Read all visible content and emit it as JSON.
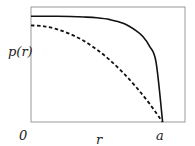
{
  "chart_data": {
    "type": "line",
    "title": "",
    "xlabel": "r",
    "ylabel": "p(r)",
    "x_ticks": [
      "0",
      "a"
    ],
    "xlim": [
      0,
      1.17
    ],
    "ylim": [
      0,
      1.0
    ],
    "grid": false,
    "legend": "none",
    "series": [
      {
        "name": "solid",
        "style": "solid",
        "color": "#111111",
        "x": [
          0,
          0.1,
          0.2,
          0.3,
          0.4,
          0.5,
          0.6,
          0.7,
          0.8,
          0.85,
          0.9,
          0.95,
          1.0
        ],
        "y": [
          0.92,
          0.92,
          0.919,
          0.917,
          0.913,
          0.906,
          0.89,
          0.858,
          0.793,
          0.743,
          0.66,
          0.52,
          0.0
        ]
      },
      {
        "name": "dashed",
        "style": "dashed",
        "color": "#111111",
        "x": [
          0,
          0.1,
          0.2,
          0.3,
          0.4,
          0.5,
          0.6,
          0.7,
          0.8,
          0.9,
          1.0
        ],
        "y": [
          0.84,
          0.832,
          0.806,
          0.764,
          0.706,
          0.63,
          0.538,
          0.428,
          0.302,
          0.16,
          0.0
        ]
      }
    ]
  }
}
